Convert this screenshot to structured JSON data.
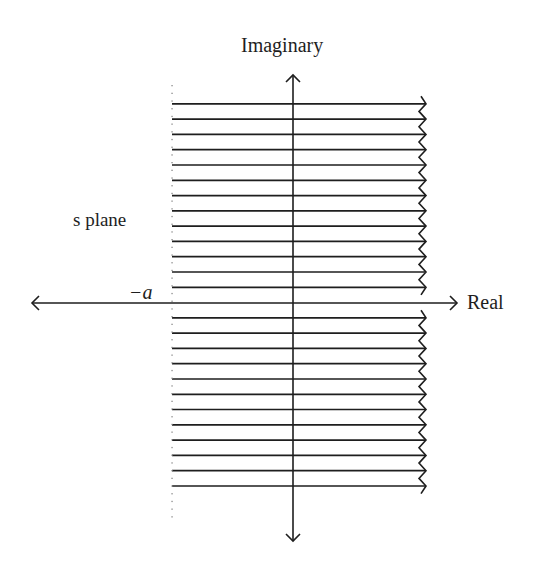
{
  "diagram": {
    "labels": {
      "imaginary_axis": "Imaginary",
      "real_axis": "Real",
      "plane": "s plane",
      "boundary": "−a"
    },
    "colors": {
      "background": "#ffffff",
      "stroke": "#1e1e1e",
      "dots": "#8a8a8a"
    },
    "geometry": {
      "origin": [
        293,
        303
      ],
      "boundary_x": 172,
      "hatch_right_x": 425,
      "hatch_spacing": 15.25,
      "hatch_lines_above_axis": 13,
      "hatch_lines_below_axis": 12,
      "imag_axis_range_y": [
        75,
        541
      ],
      "real_axis_range_x": [
        32,
        457
      ]
    },
    "region": {
      "description": "Shaded region Re(s) > -a, bounded on the left by a dotted vertical line at -a and extending to the right (wavy break edge)"
    },
    "icons": {
      "axis_arrowheads": "open-arrowhead-icon",
      "right_edge": "wavy-break-icon"
    }
  }
}
